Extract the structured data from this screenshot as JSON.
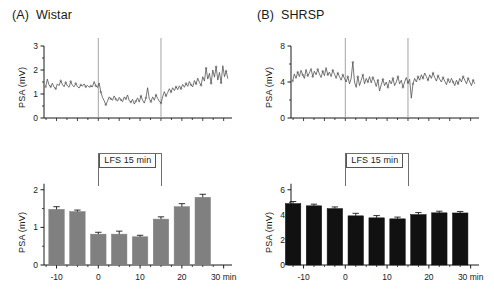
{
  "figure": {
    "background": "#ffffff",
    "ink": "#1a1a1a"
  },
  "panels": [
    {
      "tag": "(A)",
      "title": "Wistar",
      "trace_ylabel": "PSA  (mV)",
      "bar_ylabel": "PSA  (mV)",
      "lfs_label": "LFS 15 min",
      "bar_color": "#808080"
    },
    {
      "tag": "(B)",
      "title": "SHRSP",
      "trace_ylabel": "PSA  (mV)",
      "bar_ylabel": "PSA  (mV)",
      "lfs_label": "LFS 15 min",
      "bar_color": "#111111"
    }
  ],
  "chart_data": [
    {
      "type": "line",
      "panel": "A",
      "subplot": "top",
      "title": "(A) Wistar",
      "xlabel": "",
      "ylabel": "PSA  (mV)",
      "ylim": [
        0,
        3
      ],
      "yticks": [
        0,
        1,
        2,
        3
      ],
      "ytick_labels": [
        "0",
        "1",
        "2",
        "3"
      ],
      "xlim": [
        -13,
        32
      ],
      "grid": false,
      "legend": null,
      "annotations": [
        {
          "type": "vline",
          "x": 0,
          "label": "LFS onset"
        },
        {
          "type": "vline",
          "x": 15,
          "label": "LFS offset"
        }
      ],
      "x": [
        -12.6,
        -12.2,
        -11.8,
        -11.4,
        -11.0,
        -10.6,
        -10.2,
        -9.8,
        -9.4,
        -9.0,
        -8.6,
        -8.2,
        -7.8,
        -7.4,
        -7.0,
        -6.6,
        -6.2,
        -5.8,
        -5.4,
        -5.0,
        -4.6,
        -4.2,
        -3.8,
        -3.4,
        -3.0,
        -2.6,
        -2.2,
        -1.8,
        -1.4,
        -1.0,
        -0.6,
        -0.2,
        0.2,
        0.6,
        1.0,
        1.4,
        1.8,
        2.2,
        2.6,
        3.0,
        3.4,
        3.8,
        4.2,
        4.6,
        5.0,
        5.4,
        5.8,
        6.2,
        6.6,
        7.0,
        7.4,
        7.8,
        8.2,
        8.6,
        9.0,
        9.4,
        9.8,
        10.2,
        10.6,
        11.0,
        11.4,
        11.8,
        12.2,
        12.6,
        13.0,
        13.4,
        13.8,
        14.2,
        14.6,
        15.0,
        15.4,
        15.8,
        16.2,
        16.6,
        17.0,
        17.4,
        17.8,
        18.2,
        18.6,
        19.0,
        19.4,
        19.8,
        20.2,
        20.6,
        21.0,
        21.4,
        21.8,
        22.2,
        22.6,
        23.0,
        23.4,
        23.8,
        24.2,
        24.6,
        25.0,
        25.4,
        25.8,
        26.2,
        26.6,
        27.0,
        27.4,
        27.8,
        28.2,
        28.6,
        29.0,
        29.4,
        29.8,
        30.2,
        30.6,
        31.0
      ],
      "y": [
        1.3,
        1.62,
        1.38,
        1.3,
        1.45,
        1.28,
        1.22,
        1.42,
        1.35,
        1.55,
        1.4,
        1.3,
        1.48,
        1.34,
        1.28,
        1.52,
        1.36,
        1.3,
        1.44,
        1.31,
        1.25,
        1.38,
        1.33,
        1.42,
        1.3,
        1.36,
        1.28,
        1.33,
        1.3,
        1.52,
        1.34,
        1.27,
        1.46,
        1.08,
        0.86,
        0.72,
        0.55,
        0.7,
        0.88,
        0.8,
        0.74,
        0.92,
        0.78,
        0.7,
        0.86,
        0.76,
        0.68,
        0.88,
        0.8,
        0.96,
        0.72,
        0.66,
        0.78,
        0.58,
        0.7,
        0.84,
        0.66,
        0.92,
        0.74,
        0.62,
        0.84,
        1.26,
        0.8,
        0.68,
        0.88,
        0.74,
        0.96,
        0.82,
        0.7,
        0.62,
        0.88,
        1.1,
        0.92,
        1.06,
        1.22,
        1.08,
        1.26,
        1.14,
        1.3,
        1.18,
        1.34,
        1.22,
        1.4,
        1.28,
        1.44,
        1.32,
        1.52,
        1.38,
        1.3,
        1.56,
        1.42,
        1.66,
        1.48,
        1.36,
        1.72,
        1.54,
        2.08,
        1.62,
        1.86,
        1.44,
        2.0,
        1.7,
        2.14,
        1.58,
        1.9,
        1.46,
        2.18,
        1.72,
        1.96,
        1.64
      ]
    },
    {
      "type": "bar",
      "panel": "A",
      "subplot": "bottom",
      "title": "",
      "xlabel": "",
      "ylabel": "PSA  (mV)",
      "ylim": [
        0,
        2.1
      ],
      "yticks": [
        0,
        1,
        2
      ],
      "ytick_labels": [
        "0",
        "1",
        "2"
      ],
      "xticks": [
        -10,
        0,
        10,
        20,
        30
      ],
      "xtick_labels": [
        "-10",
        "0",
        "10",
        "20",
        "30 min"
      ],
      "grid": false,
      "bar_color": "#808080",
      "categories": [
        "-10",
        "-5",
        "0",
        "5",
        "10",
        "15",
        "20",
        "25"
      ],
      "centers": [
        -10,
        -5,
        0,
        5,
        10,
        15,
        20,
        25
      ],
      "values": [
        1.48,
        1.42,
        0.82,
        0.82,
        0.75,
        1.22,
        1.55,
        1.8
      ],
      "errors": [
        0.07,
        0.04,
        0.05,
        0.08,
        0.04,
        0.06,
        0.08,
        0.08
      ],
      "annotations": [
        {
          "type": "bracket",
          "label": "LFS 15 min",
          "x_start": 0,
          "x_end": 15
        }
      ]
    },
    {
      "type": "line",
      "panel": "B",
      "subplot": "top",
      "title": "(B) SHRSP",
      "xlabel": "",
      "ylabel": "PSA  (mV)",
      "ylim": [
        0,
        8
      ],
      "yticks": [
        0,
        4,
        8
      ],
      "ytick_labels": [
        "0",
        "4",
        "8"
      ],
      "xlim": [
        -13,
        32
      ],
      "grid": false,
      "legend": null,
      "annotations": [
        {
          "type": "vline",
          "x": 0,
          "label": "LFS onset"
        },
        {
          "type": "vline",
          "x": 15,
          "label": "LFS offset"
        }
      ],
      "x": [
        -12.6,
        -12.2,
        -11.8,
        -11.4,
        -11.0,
        -10.6,
        -10.2,
        -9.8,
        -9.4,
        -9.0,
        -8.6,
        -8.2,
        -7.8,
        -7.4,
        -7.0,
        -6.6,
        -6.2,
        -5.8,
        -5.4,
        -5.0,
        -4.6,
        -4.2,
        -3.8,
        -3.4,
        -3.0,
        -2.6,
        -2.2,
        -1.8,
        -1.4,
        -1.0,
        -0.6,
        -0.2,
        0.2,
        0.6,
        1.0,
        1.4,
        1.8,
        2.2,
        2.6,
        3.0,
        3.4,
        3.8,
        4.2,
        4.6,
        5.0,
        5.4,
        5.8,
        6.2,
        6.6,
        7.0,
        7.4,
        7.8,
        8.2,
        8.6,
        9.0,
        9.4,
        9.8,
        10.2,
        10.6,
        11.0,
        11.4,
        11.8,
        12.2,
        12.6,
        13.0,
        13.4,
        13.8,
        14.2,
        14.6,
        15.0,
        15.4,
        15.8,
        16.2,
        16.6,
        17.0,
        17.4,
        17.8,
        18.2,
        18.6,
        19.0,
        19.4,
        19.8,
        20.2,
        20.6,
        21.0,
        21.4,
        21.8,
        22.2,
        22.6,
        23.0,
        23.4,
        23.8,
        24.2,
        24.6,
        25.0,
        25.4,
        25.8,
        26.2,
        26.6,
        27.0,
        27.4,
        27.8,
        28.2,
        28.6,
        29.0,
        29.4,
        29.8,
        30.2,
        30.6,
        31.0
      ],
      "y": [
        4.1,
        4.9,
        4.4,
        5.1,
        4.6,
        5.3,
        4.8,
        4.4,
        5.4,
        4.7,
        5.0,
        5.5,
        4.6,
        5.2,
        4.8,
        5.4,
        4.9,
        4.5,
        5.2,
        4.7,
        5.6,
        4.8,
        5.1,
        4.6,
        5.3,
        4.9,
        4.4,
        5.0,
        4.6,
        4.2,
        4.8,
        4.4,
        4.0,
        4.6,
        3.8,
        4.4,
        6.2,
        4.0,
        3.4,
        4.6,
        3.6,
        4.2,
        4.8,
        3.8,
        4.4,
        4.0,
        4.6,
        3.9,
        4.5,
        4.1,
        3.5,
        4.2,
        3.0,
        3.7,
        4.3,
        3.6,
        4.0,
        3.4,
        4.2,
        3.8,
        4.4,
        3.6,
        4.0,
        4.6,
        3.8,
        4.2,
        3.4,
        4.0,
        4.5,
        3.9,
        4.3,
        2.2,
        3.8,
        4.4,
        4.0,
        4.6,
        4.2,
        4.8,
        4.4,
        5.0,
        4.6,
        4.2,
        4.8,
        4.4,
        5.0,
        4.5,
        4.1,
        4.7,
        4.3,
        4.0,
        4.5,
        4.1,
        3.7,
        4.3,
        3.9,
        4.4,
        4.0,
        3.6,
        4.2,
        3.8,
        4.4,
        4.0,
        4.6,
        4.2,
        3.8,
        4.4,
        4.0,
        3.6,
        4.2,
        3.8
      ]
    },
    {
      "type": "bar",
      "panel": "B",
      "subplot": "bottom",
      "title": "",
      "xlabel": "",
      "ylabel": "PSA  (mV)",
      "ylim": [
        0,
        6.3
      ],
      "yticks": [
        0,
        2,
        4,
        6
      ],
      "ytick_labels": [
        "0",
        "2",
        "4",
        "6"
      ],
      "xticks": [
        -10,
        0,
        10,
        20,
        30
      ],
      "xtick_labels": [
        "-10",
        "0",
        "10",
        "20",
        "30 min"
      ],
      "grid": false,
      "bar_color": "#111111",
      "categories": [
        "-12.5",
        "-7.5",
        "-2.5",
        "2.5",
        "7.5",
        "12.5",
        "17.5",
        "22.5",
        "27.5"
      ],
      "centers": [
        -12.5,
        -7.5,
        -2.5,
        2.5,
        7.5,
        12.5,
        17.5,
        22.5,
        27.5
      ],
      "values": [
        4.9,
        4.72,
        4.5,
        3.92,
        3.76,
        3.68,
        4.02,
        4.16,
        4.15
      ],
      "errors": [
        0.16,
        0.13,
        0.13,
        0.2,
        0.18,
        0.14,
        0.16,
        0.13,
        0.12
      ],
      "annotations": [
        {
          "type": "bracket",
          "label": "LFS 15 min",
          "x_start": 0,
          "x_end": 15
        }
      ]
    }
  ]
}
